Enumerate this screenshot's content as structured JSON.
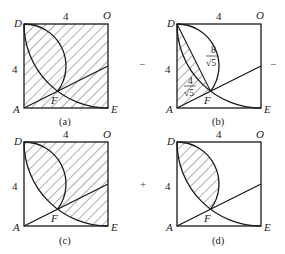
{
  "figure": {
    "operators": {
      "between_a_b": "−",
      "after_b": "−",
      "between_c_d": "+"
    },
    "panels": [
      {
        "id": "a",
        "caption": "(a)",
        "vertices": {
          "top_left": "D",
          "top_right": "O",
          "bottom_left": "A",
          "bottom_right": "E",
          "intersection": "F"
        },
        "side_top": "4",
        "side_left": "4",
        "shaded_region": "region of square outside the semicircle arc on AD and above line AF (plus area under chord)"
      },
      {
        "id": "b",
        "caption": "(b)",
        "vertices": {
          "top_left": "D",
          "top_right": "O",
          "bottom_left": "A",
          "bottom_right": "E",
          "intersection": "F"
        },
        "side_top": "4",
        "side_left": "4",
        "annotations": {
          "upper_frac_num": "8",
          "upper_frac_den": "√5",
          "lower_frac_num": "4",
          "lower_frac_den": "√5"
        },
        "shaded_region": "triangle ADF"
      },
      {
        "id": "c",
        "caption": "(c)",
        "vertices": {
          "top_left": "D",
          "top_right": "O",
          "bottom_left": "A",
          "bottom_right": "E",
          "intersection": "F"
        },
        "side_top": "4",
        "side_left": "4",
        "shaded_region": "region between quarter-circle arc DFE and sides DO, OE"
      },
      {
        "id": "d",
        "caption": "(d)",
        "vertices": {
          "top_left": "D",
          "top_right": "O",
          "bottom_left": "A",
          "bottom_right": "E",
          "intersection": "F"
        },
        "side_top": "4",
        "side_left": "4",
        "shaded_region": "lens between semicircle arc DF and quarter-circle arc DF"
      }
    ]
  },
  "colors": {
    "stroke": "#1a1a1a",
    "hatch": "#333333",
    "background": "#ffffff"
  }
}
